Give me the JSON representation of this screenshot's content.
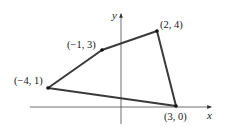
{
  "diagram": {
    "type": "coordinate-plane-quadrilateral",
    "axes": {
      "x_label": "x",
      "y_label": "y"
    },
    "vertices": [
      {
        "label": "(−4, 1)",
        "x": -4,
        "y": 1
      },
      {
        "label": "(−1, 3)",
        "x": -1,
        "y": 3
      },
      {
        "label": "(2, 4)",
        "x": 2,
        "y": 4
      },
      {
        "label": "(3, 0)",
        "x": 3,
        "y": 0
      }
    ],
    "colors": {
      "edge": "#3a3a3a",
      "axis": "#4a4a4a",
      "point": "#111111",
      "background": "#ffffff"
    }
  }
}
